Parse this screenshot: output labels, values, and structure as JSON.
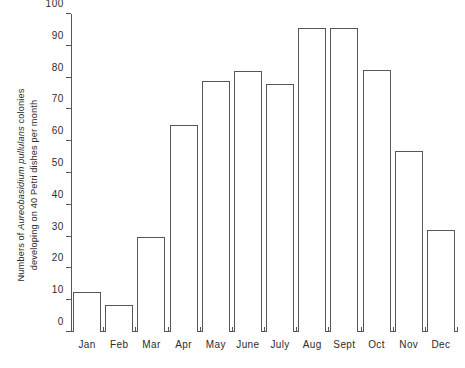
{
  "chart_data": {
    "type": "bar",
    "title": "",
    "subtitle": "",
    "xlabel": "",
    "ylabel_lines": [
      "Numbers of Aureobasidium pullulans colonies",
      "developing on 40 Petri dishes per month"
    ],
    "ylabel_prefix": "Numbers of ",
    "ylabel_species": "Aureobasidium pullulans",
    "ylabel_suffix": " colonies",
    "ylabel_line2": "developing on 40 Petri dishes per month",
    "categories": [
      "Jan",
      "Feb",
      "Mar",
      "Apr",
      "May",
      "June",
      "July",
      "Aug",
      "Sept",
      "Oct",
      "Nov",
      "Dec"
    ],
    "values": [
      12.5,
      8.5,
      30,
      65,
      79,
      82,
      78,
      95.5,
      95.5,
      82.5,
      57,
      32
    ],
    "ylim": [
      0,
      100
    ],
    "ytick_values": [
      0,
      10,
      20,
      30,
      40,
      50,
      60,
      70,
      80,
      90,
      100
    ],
    "ytick_labels": [
      "0",
      "10",
      "20",
      "30",
      "40",
      "50",
      "60",
      "70",
      "80",
      "90",
      "100"
    ],
    "grid": false,
    "legend": null,
    "bar_style": "outline",
    "bar_edge_color": "#53565a",
    "bar_fill_color": "#ffffff",
    "axis_color": "#53565a",
    "text_color": "#2b2b2b",
    "background_color": "#ffffff"
  }
}
